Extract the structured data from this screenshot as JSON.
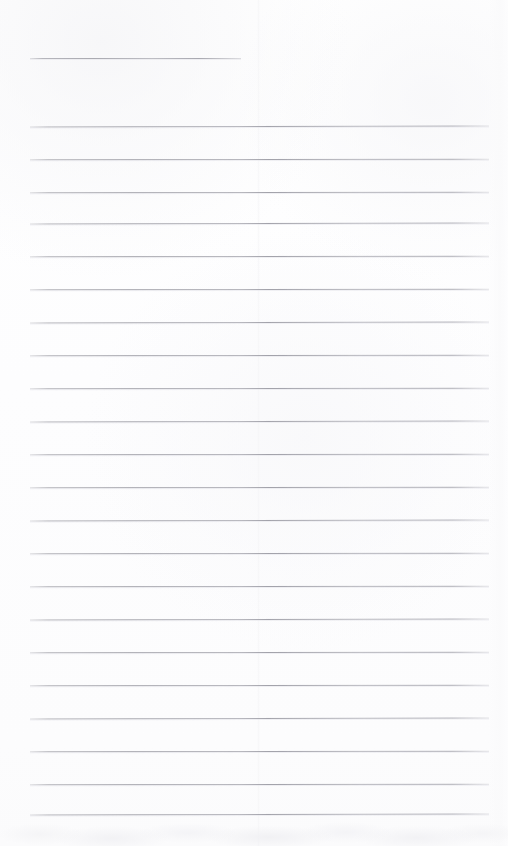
{
  "document": {
    "kind": "scanned-blank-lined-page",
    "title_text": "",
    "body_text": "",
    "page_width": 508,
    "page_height": 846,
    "background_color": "#fefefe",
    "rule_color": "#a8a8af",
    "rule_color_light": "#c4c4c9",
    "visible_text_present": false
  },
  "ruling": {
    "line_count": 24,
    "line_left_x": 30,
    "line_right_x": 489,
    "line_thickness": 1,
    "regular_spacing": 33,
    "first_gap": 68,
    "first_line_is_short": true,
    "first_line_right_x": 241,
    "lines": [
      {
        "index": 1,
        "y": 58,
        "left": 30,
        "right": 241,
        "short": true
      },
      {
        "index": 2,
        "y": 126,
        "left": 30,
        "right": 489,
        "short": false
      },
      {
        "index": 3,
        "y": 159,
        "left": 30,
        "right": 489,
        "short": false
      },
      {
        "index": 4,
        "y": 192,
        "left": 30,
        "right": 489,
        "short": false
      },
      {
        "index": 5,
        "y": 223,
        "left": 30,
        "right": 489,
        "short": false
      },
      {
        "index": 6,
        "y": 256,
        "left": 30,
        "right": 489,
        "short": false
      },
      {
        "index": 7,
        "y": 289,
        "left": 30,
        "right": 489,
        "short": false
      },
      {
        "index": 8,
        "y": 322,
        "left": 30,
        "right": 489,
        "short": false
      },
      {
        "index": 9,
        "y": 355,
        "left": 30,
        "right": 489,
        "short": false
      },
      {
        "index": 10,
        "y": 388,
        "left": 30,
        "right": 489,
        "short": false
      },
      {
        "index": 11,
        "y": 421,
        "left": 30,
        "right": 489,
        "short": false
      },
      {
        "index": 12,
        "y": 454,
        "left": 30,
        "right": 489,
        "short": false
      },
      {
        "index": 13,
        "y": 487,
        "left": 30,
        "right": 489,
        "short": false
      },
      {
        "index": 14,
        "y": 520,
        "left": 30,
        "right": 489,
        "short": false
      },
      {
        "index": 15,
        "y": 553,
        "left": 30,
        "right": 489,
        "short": false
      },
      {
        "index": 16,
        "y": 586,
        "left": 30,
        "right": 489,
        "short": false
      },
      {
        "index": 17,
        "y": 619,
        "left": 30,
        "right": 489,
        "short": false
      },
      {
        "index": 18,
        "y": 652,
        "left": 30,
        "right": 489,
        "short": false
      },
      {
        "index": 19,
        "y": 685,
        "left": 30,
        "right": 489,
        "short": false
      },
      {
        "index": 20,
        "y": 718,
        "left": 30,
        "right": 489,
        "short": false
      },
      {
        "index": 21,
        "y": 751,
        "left": 30,
        "right": 489,
        "short": false
      },
      {
        "index": 22,
        "y": 784,
        "left": 30,
        "right": 489,
        "short": false
      },
      {
        "index": 23,
        "y": 814,
        "left": 30,
        "right": 489,
        "short": false
      }
    ]
  },
  "artifacts": {
    "fold_crease_x": 258,
    "right_edge_band_width": 20,
    "bottom_smudge_height": 26
  }
}
